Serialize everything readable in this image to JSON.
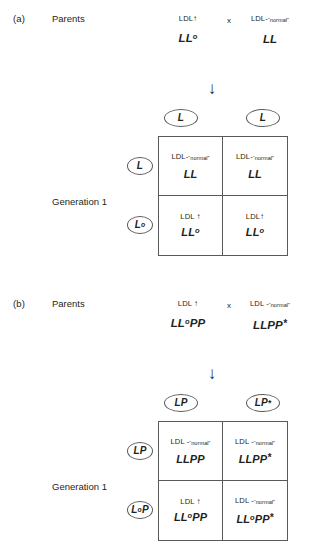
{
  "figure": {
    "panels": [
      {
        "letter": "(a)",
        "parents_label": "Parents",
        "generation_label": "Generation 1",
        "cross_symbol": "x",
        "parent_left": {
          "phenotype_text": "LDL",
          "phenotype_symbol": "↑",
          "genotype_main": "LL",
          "genotype_sup": "o",
          "genotype_star": ""
        },
        "parent_right": {
          "phenotype_text": "LDL-",
          "phenotype_sub": "“normal”",
          "genotype_main": "LL",
          "genotype_sup": "",
          "genotype_star": ""
        },
        "gametes_top": [
          {
            "main": "L",
            "sup": "",
            "star": ""
          },
          {
            "main": "L",
            "sup": "",
            "star": ""
          }
        ],
        "gametes_side": [
          {
            "main": "L",
            "sup": "",
            "star": ""
          },
          {
            "main": "L",
            "sup": "o",
            "star": ""
          }
        ],
        "cells": [
          {
            "phenotype_text": "LDL-",
            "phenotype_sub": "“normal”",
            "phenotype_symbol": "",
            "genotype_main": "LL",
            "genotype_sup": "",
            "genotype_star": ""
          },
          {
            "phenotype_text": "LDL-",
            "phenotype_sub": "“normal”",
            "phenotype_symbol": "",
            "genotype_main": "LL",
            "genotype_sup": "",
            "genotype_star": ""
          },
          {
            "phenotype_text": "LDL",
            "phenotype_sub": "",
            "phenotype_symbol": "↑",
            "genotype_main": "LL",
            "genotype_sup": "o",
            "genotype_star": ""
          },
          {
            "phenotype_text": "LDL",
            "phenotype_sub": "",
            "phenotype_symbol": "↑",
            "genotype_main": "LL",
            "genotype_sup": "o",
            "genotype_star": ""
          }
        ]
      },
      {
        "letter": "(b)",
        "parents_label": "Parents",
        "generation_label": "Generation 1",
        "cross_symbol": "x",
        "parent_left": {
          "phenotype_text": "LDL",
          "phenotype_symbol": "↑",
          "genotype_main": "LL",
          "genotype_sup": "o",
          "genotype_tail": "PP",
          "genotype_star": ""
        },
        "parent_right": {
          "phenotype_text": "LDL -",
          "phenotype_sub": "“normal”",
          "genotype_main": "LLPP",
          "genotype_sup": "",
          "genotype_star": "*"
        },
        "gametes_top": [
          {
            "main": "LP",
            "sup": "",
            "star": ""
          },
          {
            "main": "LP",
            "sup": "",
            "star": "*"
          }
        ],
        "gametes_side": [
          {
            "main": "LP",
            "sup": "",
            "star": ""
          },
          {
            "main": "L",
            "sup": "o",
            "tail": "P",
            "star": ""
          }
        ],
        "cells": [
          {
            "phenotype_text": "LDL -",
            "phenotype_sub": "“normal”",
            "phenotype_symbol": "",
            "genotype_main": "LLPP",
            "genotype_sup": "",
            "genotype_star": ""
          },
          {
            "phenotype_text": "LDL -",
            "phenotype_sub": "“normal”",
            "phenotype_symbol": "",
            "genotype_main": "LLPP",
            "genotype_sup": "",
            "genotype_star": "*"
          },
          {
            "phenotype_text": "LDL",
            "phenotype_sub": "",
            "phenotype_symbol": "↑",
            "genotype_main": "LL",
            "genotype_sup": "o",
            "genotype_tail": "PP",
            "genotype_star": ""
          },
          {
            "phenotype_text": "LDL -",
            "phenotype_sub": "“normal”",
            "phenotype_symbol": "",
            "genotype_main": "LL",
            "genotype_sup": "o",
            "genotype_tail": "PP",
            "genotype_star": "*"
          }
        ]
      }
    ],
    "arrow_glyph": "↓"
  }
}
